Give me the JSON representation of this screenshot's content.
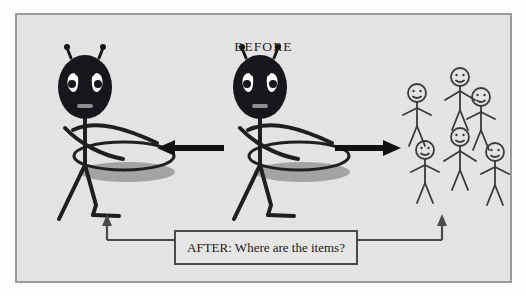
{
  "figure": {
    "title": "BEFORE",
    "caption": "AFTER: Where are the items?",
    "background_color": "#e6e6e6",
    "border_color": "#9a9a9a",
    "ink_color": "#1a1a1a",
    "shadow_color": "#9e9e9e",
    "arrows": [
      {
        "name": "left-arrow",
        "direction": "left"
      },
      {
        "name": "right-arrow",
        "direction": "right"
      }
    ],
    "characters": {
      "waiter_left_label": "waiter-figure-left",
      "waiter_middle_label": "waiter-figure-middle",
      "crowd_count": 6,
      "crowd_label": "customer-stick-figures"
    },
    "connector": {
      "left_target": "waiter-figure-left",
      "right_target": "customer-stick-figures"
    }
  }
}
